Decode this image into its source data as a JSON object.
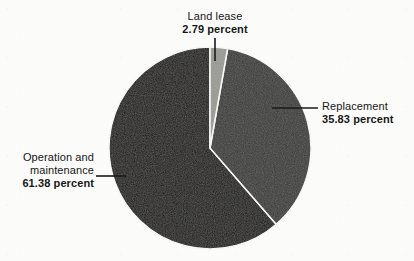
{
  "figure": {
    "background_color": "#fbfbf9",
    "width": 414,
    "height": 261
  },
  "chart_data": {
    "type": "pie",
    "title": "",
    "subtitle": "",
    "xlabel": "",
    "ylabel": "",
    "legend_position": "none",
    "grid": false,
    "value_unit": "percent",
    "start_angle_deg": 0,
    "direction": "clockwise",
    "categories": [
      "Land lease",
      "Replacement",
      "Operation and maintenance"
    ],
    "values": [
      2.79,
      35.83,
      61.38
    ],
    "colors": [
      "#9a9a95",
      "#3b3b38",
      "#1b1815"
    ],
    "slices": [
      {
        "label": "Land lease",
        "value": 2.79,
        "value_text": "2.79 percent",
        "color": "#9a9a95",
        "start_angle_deg": 0,
        "end_angle_deg": 10.044
      },
      {
        "label": "Replacement",
        "value": 35.83,
        "value_text": "35.83 percent",
        "color": "#3b3b38",
        "start_angle_deg": 10.044,
        "end_angle_deg": 139.032
      },
      {
        "label": "Operation and maintenance",
        "value": 61.38,
        "value_text": "61.38 percent",
        "color": "#1b1815",
        "start_angle_deg": 139.032,
        "end_angle_deg": 360
      }
    ],
    "geometry": {
      "center_x": 210,
      "center_y": 148,
      "radius": 101,
      "slice_gap_color": "#fbfbf9"
    }
  },
  "labels": {
    "land_lease": {
      "name": "Land lease",
      "percent_text": "2.79 percent"
    },
    "replacement": {
      "name": "Replacement",
      "percent_text": "35.83 percent"
    },
    "operation": {
      "name_line1": "Operation and",
      "name_line2": "maintenance",
      "percent_text": "61.38 percent"
    }
  },
  "leader_lines": {
    "color": "#1a1a1a",
    "land_lease": {
      "x1": 215,
      "y1": 38,
      "x2": 215,
      "y2": 61
    },
    "replacement": {
      "x1": 272,
      "y1": 108,
      "x2": 318,
      "y2": 108
    },
    "operation": {
      "x1": 96,
      "y1": 176,
      "x2": 126,
      "y2": 176
    }
  }
}
